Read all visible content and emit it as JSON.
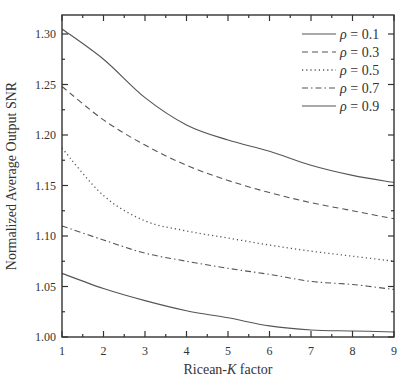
{
  "chart_data": {
    "type": "line",
    "title": "",
    "xlabel": "Ricean-K factor",
    "xlabel_parts": [
      "Ricean-",
      "K",
      " factor"
    ],
    "ylabel": "Normalized Average Output SNR",
    "xlim": [
      1,
      9
    ],
    "ylim": [
      1.0,
      1.32
    ],
    "grid": false,
    "legend_position": "upper right",
    "x_ticks": [
      1,
      2,
      3,
      4,
      5,
      6,
      7,
      8,
      9
    ],
    "x_tick_labels": [
      "1",
      "2",
      "3",
      "4",
      "5",
      "6",
      "7",
      "8",
      "9"
    ],
    "y_ticks": [
      1.0,
      1.05,
      1.1,
      1.15,
      1.2,
      1.25,
      1.3
    ],
    "y_tick_labels": [
      "1.00",
      "1.05",
      "1.10",
      "1.15",
      "1.20",
      "1.25",
      "1.30"
    ],
    "x": [
      1,
      2,
      3,
      4,
      5,
      6,
      7,
      8,
      9
    ],
    "series": [
      {
        "name": "ρ = 0.1",
        "rho": "0.1",
        "style": "solid",
        "values": [
          1.305,
          1.275,
          1.237,
          1.21,
          1.195,
          1.184,
          1.17,
          1.16,
          1.153
        ]
      },
      {
        "name": "ρ = 0.3",
        "rho": "0.3",
        "style": "dashed",
        "values": [
          1.248,
          1.215,
          1.19,
          1.17,
          1.155,
          1.143,
          1.133,
          1.125,
          1.117
        ]
      },
      {
        "name": "ρ = 0.5",
        "rho": "0.5",
        "style": "dotted",
        "values": [
          1.187,
          1.14,
          1.115,
          1.105,
          1.098,
          1.091,
          1.085,
          1.08,
          1.075
        ]
      },
      {
        "name": "ρ = 0.7",
        "rho": "0.7",
        "style": "dashdot",
        "values": [
          1.11,
          1.096,
          1.083,
          1.075,
          1.068,
          1.062,
          1.055,
          1.052,
          1.047
        ]
      },
      {
        "name": "ρ = 0.9",
        "rho": "0.9",
        "style": "solid",
        "values": [
          1.063,
          1.048,
          1.036,
          1.026,
          1.019,
          1.011,
          1.007,
          1.006,
          1.005
        ]
      }
    ],
    "colors": {
      "line": "#555555",
      "axis": "#333333",
      "text": "#333333"
    }
  }
}
